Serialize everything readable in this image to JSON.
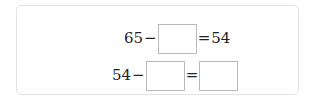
{
  "problem": {
    "row1": {
      "left_number": "65",
      "operator": "−",
      "answer_box_value": "",
      "equals": "=",
      "result": "54"
    },
    "row2": {
      "left_number": "54",
      "operator": "−",
      "answer_box_1_value": "",
      "equals": "=",
      "answer_box_2_value": ""
    }
  },
  "colors": {
    "text": "#222222",
    "box_border": "#b9b9b9",
    "card_border": "#e3e3e3"
  }
}
